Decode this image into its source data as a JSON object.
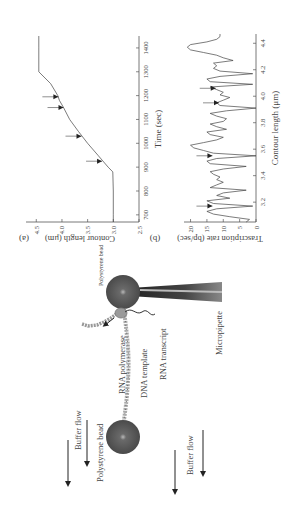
{
  "figure": {
    "panel_a": {
      "label": "(a)",
      "xlabel": "Time (sec)",
      "ylabel": "Contour length (μm)",
      "x_ticks": [
        "700",
        "800",
        "900",
        "1000",
        "1100",
        "1200",
        "1300",
        "1400"
      ],
      "y_ticks": [
        "2.5",
        "3.0",
        "3.5",
        "4.0",
        "4.5"
      ]
    },
    "panel_b": {
      "label": "(b)",
      "xlabel": "Contour length (μm)",
      "ylabel": "Trascription rate (bp/sec)",
      "x_ticks": [
        "3.2",
        "3.4",
        "3.6",
        "3.8",
        "4.0",
        "4.2",
        "4.4"
      ],
      "y_ticks": [
        "0",
        "5",
        "10",
        "15",
        "20"
      ]
    },
    "diagram": {
      "bead_top_label": "Polystyrene bead",
      "bead_bottom_label": "Polystyrene bead",
      "rna_polymerase_label": "RNA polymerase",
      "dna_template_label": "DNA template",
      "rna_transcript_label": "RNA transcript",
      "micropipette_label": "Micropipette",
      "buffer_flow_left_label": "Buffer flow",
      "buffer_flow_right_label": "Buffer flow"
    }
  },
  "chart_data": [
    {
      "type": "line",
      "panel": "(a)",
      "title": "",
      "xlabel": "Time (sec)",
      "ylabel": "Contour length (μm)",
      "xlim": [
        670,
        1450
      ],
      "ylim": [
        2.5,
        4.7
      ],
      "x": [
        670,
        700,
        800,
        880,
        900,
        950,
        1000,
        1050,
        1100,
        1150,
        1180,
        1200,
        1250,
        1300,
        1400,
        1450
      ],
      "series": [
        {
          "name": "contour length",
          "values": [
            3.0,
            3.0,
            3.0,
            3.01,
            3.1,
            3.3,
            3.5,
            3.68,
            3.85,
            3.97,
            4.05,
            4.08,
            4.22,
            4.45,
            4.45,
            4.45
          ]
        }
      ],
      "annotations": [
        {
          "type": "arrow",
          "x": 925,
          "y": 3.2
        },
        {
          "type": "arrow",
          "x": 1030,
          "y": 3.6
        },
        {
          "type": "arrow",
          "x": 1150,
          "y": 3.95
        },
        {
          "type": "arrow",
          "x": 1195,
          "y": 4.05
        }
      ],
      "grid": false
    },
    {
      "type": "line",
      "panel": "(b)",
      "title": "",
      "xlabel": "Contour length (μm)",
      "ylabel": "Trascription rate (bp/sec)",
      "xlim": [
        3.05,
        4.47
      ],
      "ylim": [
        0,
        22
      ],
      "x": [
        3.05,
        3.07,
        3.09,
        3.11,
        3.13,
        3.15,
        3.17,
        3.19,
        3.21,
        3.23,
        3.25,
        3.27,
        3.29,
        3.31,
        3.33,
        3.35,
        3.37,
        3.39,
        3.41,
        3.43,
        3.45,
        3.47,
        3.49,
        3.51,
        3.53,
        3.55,
        3.57,
        3.59,
        3.61,
        3.63,
        3.65,
        3.67,
        3.69,
        3.71,
        3.73,
        3.75,
        3.77,
        3.79,
        3.81,
        3.83,
        3.85,
        3.87,
        3.89,
        3.91,
        3.93,
        3.95,
        3.97,
        3.99,
        4.01,
        4.03,
        4.05,
        4.07,
        4.09,
        4.11,
        4.13,
        4.15,
        4.17,
        4.19,
        4.21,
        4.23,
        4.25,
        4.27,
        4.29,
        4.31,
        4.33,
        4.35,
        4.37,
        4.39,
        4.41,
        4.43,
        4.45,
        4.47
      ],
      "series": [
        {
          "name": "rate",
          "values": [
            3,
            2,
            8,
            13,
            15,
            12,
            1,
            13,
            15,
            8,
            12,
            10,
            3,
            14,
            12,
            10,
            12,
            11,
            13,
            14,
            10,
            3,
            14,
            15,
            12,
            0,
            13,
            16,
            19,
            20,
            16,
            12,
            10,
            14,
            15,
            9,
            12,
            14,
            10,
            9,
            12,
            14,
            9,
            0,
            11,
            12,
            10,
            8,
            11,
            10,
            12,
            14,
            1,
            14,
            15,
            11,
            1,
            11,
            13,
            12,
            13,
            7,
            10,
            12,
            16,
            20,
            21,
            20,
            15,
            12,
            11,
            11
          ]
        }
      ],
      "annotations": [
        {
          "type": "arrow",
          "x": 3.17,
          "y": 13
        },
        {
          "type": "arrow",
          "x": 3.55,
          "y": 13
        },
        {
          "type": "arrow",
          "x": 3.95,
          "y": 11
        },
        {
          "type": "arrow",
          "x": 4.06,
          "y": 12
        }
      ],
      "grid": false
    }
  ]
}
